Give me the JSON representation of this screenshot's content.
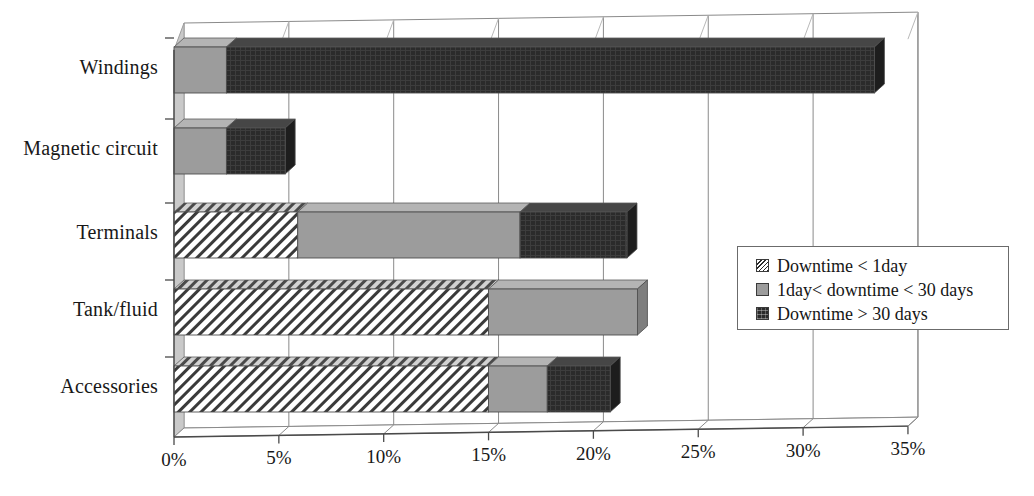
{
  "chart_data": {
    "type": "bar",
    "orientation": "horizontal",
    "stacked": true,
    "three_d": true,
    "title": "",
    "xlabel": "",
    "ylabel": "",
    "xlim": [
      0,
      35
    ],
    "xtick_step": 5,
    "grid": true,
    "legend_position": "right",
    "categories": [
      "Windings",
      "Magnetic circuit",
      "Terminals",
      "Tank/fluid",
      "Accessories"
    ],
    "xticks": [
      "0%",
      "5%",
      "10%",
      "15%",
      "20%",
      "25%",
      "30%",
      "35%"
    ],
    "xtick_values": [
      0,
      5,
      10,
      15,
      20,
      25,
      30,
      35
    ],
    "series": [
      {
        "name": "Downtime < 1day",
        "fill": "hatch",
        "color": "#ffffff",
        "values": [
          0,
          0,
          5.9,
          15.0,
          15.0
        ]
      },
      {
        "name": "1day< downtime < 30 days",
        "fill": "solid",
        "color": "#9c9c9c",
        "values": [
          2.5,
          2.5,
          10.6,
          7.1,
          2.8
        ]
      },
      {
        "name": "Downtime > 30 days",
        "fill": "solid",
        "color": "#2b2b2b",
        "values": [
          30.9,
          2.8,
          5.1,
          0,
          3.0
        ]
      }
    ],
    "totals": [
      33.4,
      5.3,
      21.6,
      22.1,
      20.8
    ]
  },
  "legend": {
    "items": [
      {
        "label": "Downtime < 1day",
        "swatch": "hatch"
      },
      {
        "label": "1day< downtime < 30 days",
        "swatch": "gray"
      },
      {
        "label": "Downtime > 30 days",
        "swatch": "dark"
      }
    ]
  },
  "axis": {
    "categories": [
      {
        "label": "Windings"
      },
      {
        "label": "Magnetic circuit"
      },
      {
        "label": "Terminals"
      },
      {
        "label": "Tank/fluid"
      },
      {
        "label": "Accessories"
      }
    ],
    "xticks": [
      {
        "label": "0%"
      },
      {
        "label": "5%"
      },
      {
        "label": "10%"
      },
      {
        "label": "15%"
      },
      {
        "label": "20%"
      },
      {
        "label": "25%"
      },
      {
        "label": "30%"
      },
      {
        "label": "35%"
      }
    ]
  },
  "colors": {
    "hatch_line": "#2b2b2b",
    "segment_gray": "#9c9c9c",
    "segment_dark": "#2b2b2b",
    "wall": "#c9c9c9",
    "floor": "#ffffff",
    "gridline": "#8a8a8a",
    "axis": "#4a4a4a",
    "text": "#181818"
  }
}
